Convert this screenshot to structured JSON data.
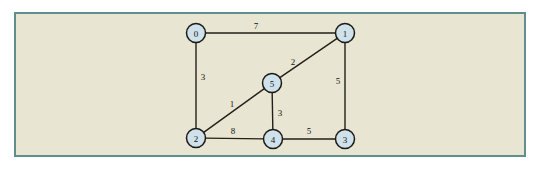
{
  "figure": {
    "kind": "weighted-undirected-graph",
    "panel_background_color": "#e9e5d3",
    "panel_border_color": "#5e8f8c",
    "page_background_color": "#ffffff",
    "node_fill_color": "#cfe2ec",
    "node_stroke_color": "#1b1a15",
    "edge_color": "#222018",
    "label_color": "#15130f"
  },
  "graph_data": {
    "type": "diagram",
    "directed": false,
    "weighted": true,
    "node_count": 6,
    "edge_count": 8,
    "nodes": [
      {
        "id": "0",
        "label": "0",
        "x": 196,
        "y": 33
      },
      {
        "id": "1",
        "label": "1",
        "x": 345,
        "y": 33
      },
      {
        "id": "2",
        "label": "2",
        "x": 196,
        "y": 138
      },
      {
        "id": "3",
        "label": "3",
        "x": 345,
        "y": 139
      },
      {
        "id": "4",
        "label": "4",
        "x": 273,
        "y": 139
      },
      {
        "id": "5",
        "label": "5",
        "x": 272,
        "y": 83
      }
    ],
    "edges": [
      {
        "from": "0",
        "to": "1",
        "weight": "7",
        "lx": 256,
        "ly": 26
      },
      {
        "from": "0",
        "to": "2",
        "weight": "3",
        "lx": 203,
        "ly": 77
      },
      {
        "from": "1",
        "to": "5",
        "weight": "2",
        "lx": 293,
        "ly": 62
      },
      {
        "from": "1",
        "to": "3",
        "weight": "5",
        "lx": 338,
        "ly": 81
      },
      {
        "from": "2",
        "to": "5",
        "weight": "1",
        "lx": 232,
        "ly": 104
      },
      {
        "from": "5",
        "to": "4",
        "weight": "3",
        "lx": 280,
        "ly": 113
      },
      {
        "from": "2",
        "to": "4",
        "weight": "8",
        "lx": 233,
        "ly": 131
      },
      {
        "from": "4",
        "to": "3",
        "weight": "5",
        "lx": 309,
        "ly": 131
      }
    ]
  }
}
